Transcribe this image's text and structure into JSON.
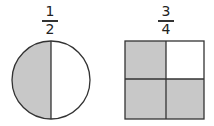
{
  "figures": [
    {
      "shape": "circle",
      "fraction": {
        "numerator": "1",
        "denominator": "2"
      },
      "parts": 2,
      "shaded": 1
    },
    {
      "shape": "square",
      "fraction": {
        "numerator": "3",
        "denominator": "4"
      },
      "parts": 4,
      "shaded": 3
    }
  ],
  "colors": {
    "shade": "#c8c8c8",
    "stroke": "#333333",
    "background": "#ffffff"
  }
}
